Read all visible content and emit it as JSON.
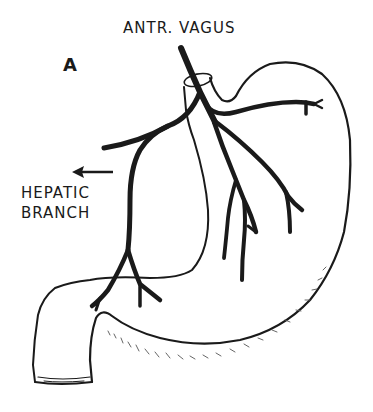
{
  "figure": {
    "panel_letter": "A",
    "title": "ANTR. VAGUS",
    "labels": {
      "hepatic_line1": "HEPATIC",
      "hepatic_line2": "BRANCH"
    },
    "arrow": {
      "direction": "left",
      "points_to": "hepatic branch"
    },
    "colors": {
      "ink": "#1a1a1a",
      "background": "#ffffff"
    }
  }
}
